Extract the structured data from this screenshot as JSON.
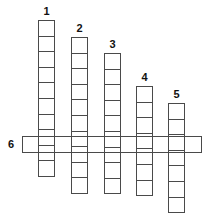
{
  "puzzle": {
    "clues": [
      {
        "number": "1",
        "direction": "down",
        "left": 38,
        "top": 20,
        "cells": 10
      },
      {
        "number": "2",
        "direction": "down",
        "left": 71,
        "top": 37,
        "cells": 10
      },
      {
        "number": "3",
        "direction": "down",
        "left": 104,
        "top": 53,
        "cells": 9
      },
      {
        "number": "4",
        "direction": "down",
        "left": 136,
        "top": 86,
        "cells": 7
      },
      {
        "number": "5",
        "direction": "down",
        "left": 168,
        "top": 103,
        "cells": 7
      }
    ],
    "across": {
      "number": "6",
      "direction": "across",
      "left": 22,
      "top": 136,
      "width": 180
    }
  }
}
